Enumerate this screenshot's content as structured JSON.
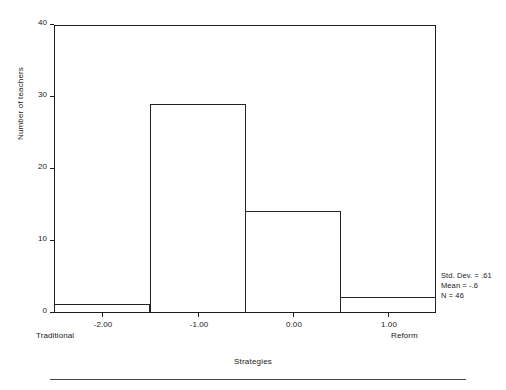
{
  "chart_data": {
    "type": "bar",
    "title": "",
    "subtitle": "",
    "xlabel": "Strategies",
    "ylabel": "Number of teachers",
    "categories": [
      "-2.00",
      "-1.00",
      "0.00",
      "1.00"
    ],
    "values": [
      1,
      29,
      14,
      2
    ],
    "bin_centers": [
      -2.0,
      -1.0,
      0.0,
      1.0
    ],
    "bin_width": 1.0,
    "xlim": [
      -2.5,
      1.5
    ],
    "ylim": [
      0,
      40
    ],
    "y_ticks": [
      0,
      10,
      20,
      30,
      40
    ],
    "y_tick_labels": [
      "0",
      "10",
      "20",
      "30",
      "40"
    ],
    "x_ticks": [
      -2.0,
      -1.0,
      0.0,
      1.0
    ],
    "x_tick_labels": [
      "-2.00",
      "-1.00",
      "0.00",
      "1.00"
    ],
    "grid": false,
    "legend": false,
    "bar_fill": "#ffffff",
    "bar_edge": "#252525",
    "axis_color": "#1d1d1d",
    "background": "#ffffff",
    "x_axis_anchor_left": "Traditional",
    "x_axis_anchor_right": "Reform",
    "annotations": [
      "Std. Dev. = .61",
      "Mean = -.6",
      "N = 46"
    ]
  },
  "axes": {
    "y": {
      "title": "Number of teachers",
      "ticks": [
        {
          "value": 40,
          "label": "40"
        },
        {
          "value": 30,
          "label": "30"
        },
        {
          "value": 20,
          "label": "20"
        },
        {
          "value": 10,
          "label": "10"
        },
        {
          "value": 0,
          "label": "0"
        }
      ]
    },
    "x": {
      "title": "Strategies",
      "ticks": [
        {
          "value": -2.0,
          "label": "-2.00"
        },
        {
          "value": -1.0,
          "label": "-1.00"
        },
        {
          "value": 0.0,
          "label": "0.00"
        },
        {
          "value": 1.0,
          "label": "1.00"
        }
      ],
      "anchor_left": "Traditional",
      "anchor_right": "Reform"
    }
  },
  "stats": {
    "std_dev": "Std. Dev. = .61",
    "mean": "Mean = -.6",
    "n": "N = 46"
  },
  "bars": [
    {
      "label": "-2.00",
      "value": 1
    },
    {
      "label": "-1.00",
      "value": 29
    },
    {
      "label": "0.00",
      "value": 14
    },
    {
      "label": "1.00",
      "value": 2
    }
  ]
}
